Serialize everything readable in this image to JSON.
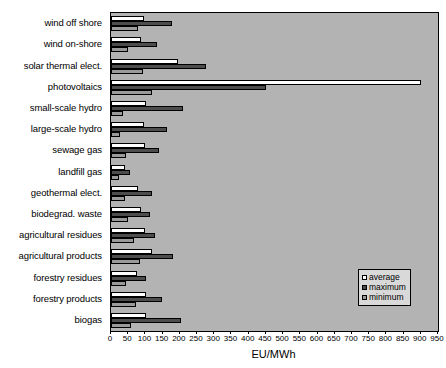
{
  "chart_data": {
    "type": "bar",
    "orientation": "horizontal",
    "title": "",
    "xlabel": "EU/MWh",
    "ylabel": "",
    "xlim": [
      0,
      950
    ],
    "xticks": [
      0,
      50,
      100,
      150,
      200,
      250,
      300,
      350,
      400,
      450,
      500,
      550,
      600,
      650,
      700,
      750,
      800,
      850,
      900,
      950
    ],
    "grid": false,
    "legend_position": "lower-right",
    "plot_background": "#b3b3b3",
    "categories": [
      "wind off shore",
      "wind on-shore",
      "solar thermal elect.",
      "photovoltaics",
      "small-scale hydro",
      "large-scale hydro",
      "sewage gas",
      "landfill gas",
      "geothermal elect.",
      "biodegrad. waste",
      "agricultural residues",
      "agricultural products",
      "forestry residues",
      "forestry products",
      "biogas"
    ],
    "series": [
      {
        "name": "average",
        "color": "#ffffff",
        "values": [
          95,
          88,
          195,
          900,
          102,
          95,
          100,
          42,
          78,
          88,
          100,
          120,
          75,
          103,
          103
        ]
      },
      {
        "name": "maximum",
        "color": "#4d4d4d",
        "values": [
          177,
          135,
          276,
          450,
          209,
          163,
          140,
          55,
          118,
          112,
          128,
          180,
          103,
          148,
          203
        ]
      },
      {
        "name": "minimum",
        "color": "#9a9a9a",
        "values": [
          78,
          48,
          93,
          120,
          35,
          25,
          45,
          22,
          40,
          50,
          68,
          85,
          45,
          73,
          58
        ]
      }
    ]
  },
  "legend": {
    "items": [
      {
        "label": "average",
        "key": "average"
      },
      {
        "label": "maximum",
        "key": "maximum"
      },
      {
        "label": "minimum",
        "key": "minimum"
      }
    ]
  }
}
